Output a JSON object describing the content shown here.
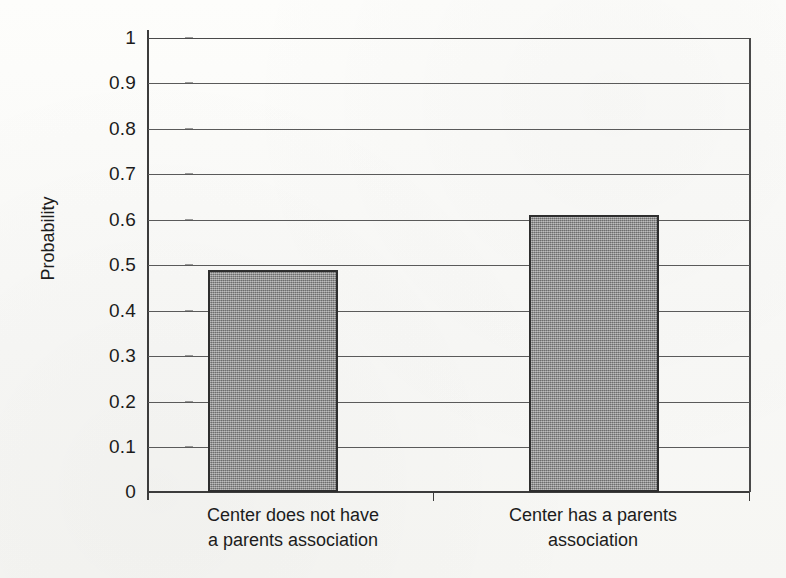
{
  "chart_data": {
    "type": "bar",
    "title": "",
    "subtitle": "",
    "xlabel": "",
    "ylabel": "Probability",
    "categories": [
      "Center does not have\na parents association",
      "Center has a parents\nassociation"
    ],
    "category_lines": [
      [
        "Center does not have",
        "a parents association"
      ],
      [
        "Center has a parents",
        "association"
      ]
    ],
    "values": [
      0.49,
      0.61
    ],
    "ylim": [
      0,
      1
    ],
    "ytick_values": [
      1,
      0.9,
      0.8,
      0.7,
      0.6,
      0.5,
      0.4,
      0.3,
      0.2,
      0.1,
      0
    ],
    "ytick_labels": [
      "1",
      "0.9",
      "0.8",
      "0.7",
      "0.6",
      "0.5",
      "0.4",
      "0.3",
      "0.2",
      "0.1",
      "0"
    ],
    "grid": true,
    "grid_orientation": "horizontal",
    "legend": false,
    "legend_position": "none",
    "bar_fill_color": "#8a8a8a",
    "bar_border_color": "#2e2e2e",
    "axis_color": "#3c3c3c",
    "grid_color": "#5a5a5a",
    "background_color": "#fbfbf9",
    "text_color": "#1c1c1c"
  },
  "figure": {
    "ylabel": "Probability",
    "ytick_0": "1",
    "ytick_1": "0.9",
    "ytick_2": "0.8",
    "ytick_3": "0.7",
    "ytick_4": "0.6",
    "ytick_5": "0.5",
    "ytick_6": "0.4",
    "ytick_7": "0.3",
    "ytick_8": "0.2",
    "ytick_9": "0.1",
    "ytick_10": "0",
    "cat0_line0": "Center does not have",
    "cat0_line1": "a parents association",
    "cat1_line0": "Center has a parents",
    "cat1_line1": "association"
  }
}
